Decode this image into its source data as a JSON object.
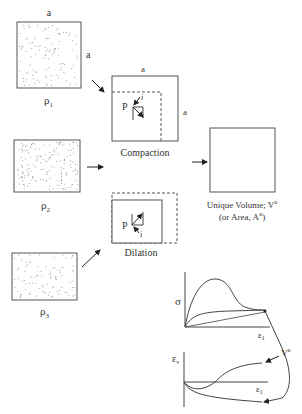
{
  "labels": {
    "side_a_top": "a",
    "side_a_right": "a",
    "rho1": "ρ",
    "rho1_sub": "1",
    "rho2": "ρ",
    "rho2_sub": "2",
    "rho3": "ρ",
    "rho3_sub": "3",
    "compaction_side_top": "a",
    "compaction_side_right": "a",
    "compaction_point": "P",
    "compaction_i": "i",
    "compaction_caption": "Compaction",
    "dilation_point": "P",
    "dilation_i": "i",
    "dilation_caption": "Dilation",
    "unique_volume_line1": "Unique Volume; V",
    "unique_volume_sup": "u",
    "unique_volume_line2": "(or Area, A",
    "unique_area_sup": "u",
    "unique_volume_close": ")",
    "graph1_y": "σ",
    "graph1_x": "ε",
    "graph1_x_sub": "1",
    "graph2_y": "ε",
    "graph2_y_sub": "v",
    "graph2_x": "ε",
    "graph2_x_sub": "1",
    "vu_label": "V",
    "vu_sup": "u"
  },
  "colors": {
    "line": "#444444",
    "dots": "#777777",
    "background": "#ffffff"
  }
}
